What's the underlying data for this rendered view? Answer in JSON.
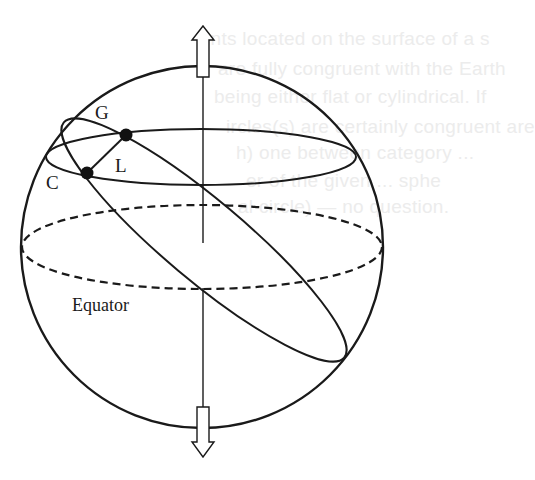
{
  "figure": {
    "labels": {
      "point_g": "G",
      "point_l": "L",
      "point_c": "C",
      "equator": "Equator"
    },
    "colors": {
      "ink": "#1a1a1a",
      "background": "#ffffff",
      "bleed_text": "#ececec"
    }
  },
  "bleed_through_text": [
    "ints located on the surface of a s",
    "are fully congruent with the Earth",
    "being either flat or cylindrical. If",
    "ircles(s) are certainly congruent are",
    "h) one between category ...",
    "er of the given ... sphe",
    "al circle) — no question."
  ]
}
